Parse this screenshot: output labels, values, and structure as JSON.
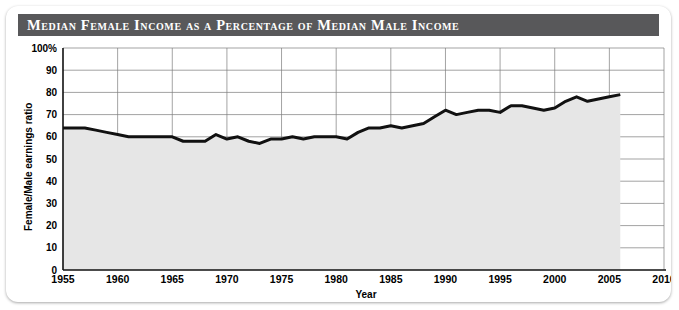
{
  "title": "Median Female Income as a Percentage of Median Male Income",
  "chart_data": {
    "type": "line",
    "title": "Median Female Income as a Percentage of Median Male Income",
    "xlabel": "Year",
    "ylabel": "Female/Male earnings ratio",
    "xlim": [
      1955,
      2010
    ],
    "ylim": [
      0,
      100
    ],
    "xticks": [
      1955,
      1960,
      1965,
      1970,
      1975,
      1980,
      1985,
      1990,
      1995,
      2000,
      2005,
      2010
    ],
    "yticks": [
      0,
      10,
      20,
      30,
      40,
      50,
      60,
      70,
      80,
      90,
      100
    ],
    "ytick_labels": [
      "0",
      "10",
      "20",
      "30",
      "40",
      "50",
      "60",
      "70",
      "80",
      "90",
      "100%"
    ],
    "grid": true,
    "legend": false,
    "fill": "below-line",
    "fill_color": "#e6e6e6",
    "line_color": "#111111",
    "series": [
      {
        "name": "Female/Male earnings ratio",
        "x": [
          1955,
          1956,
          1957,
          1958,
          1959,
          1960,
          1961,
          1962,
          1963,
          1964,
          1965,
          1966,
          1967,
          1968,
          1969,
          1970,
          1971,
          1972,
          1973,
          1974,
          1975,
          1976,
          1977,
          1978,
          1979,
          1980,
          1981,
          1982,
          1983,
          1984,
          1985,
          1986,
          1987,
          1988,
          1989,
          1990,
          1991,
          1992,
          1993,
          1994,
          1995,
          1996,
          1997,
          1998,
          1999,
          2000,
          2001,
          2002,
          2003,
          2004,
          2005,
          2006
        ],
        "values": [
          64,
          64,
          64,
          63,
          62,
          61,
          60,
          60,
          60,
          60,
          60,
          58,
          58,
          58,
          61,
          59,
          60,
          58,
          57,
          59,
          59,
          60,
          59,
          60,
          60,
          60,
          59,
          62,
          64,
          64,
          65,
          64,
          65,
          66,
          69,
          72,
          70,
          71,
          72,
          72,
          71,
          74,
          74,
          73,
          72,
          73,
          76,
          78,
          76,
          77,
          78,
          79
        ]
      }
    ]
  },
  "axes": {
    "y_title": "Female/Male earnings ratio",
    "x_title": "Year"
  }
}
